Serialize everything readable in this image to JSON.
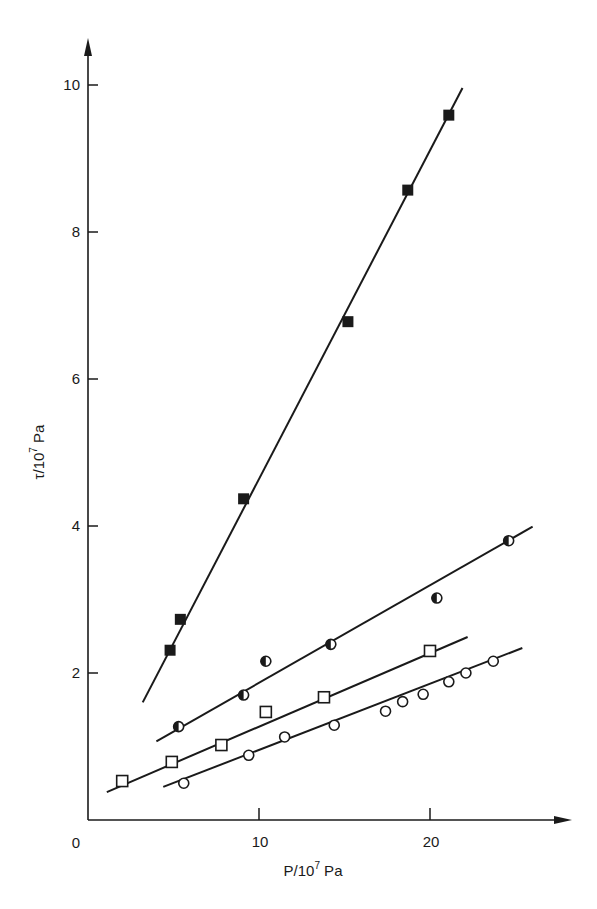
{
  "chart_data": {
    "type": "scatter",
    "title": "",
    "xlabel": "P/10^7 Pa",
    "ylabel": "τ/10^7 Pa",
    "xlabel_parts": {
      "base": "P/10",
      "sup": "7",
      "unit": " Pa"
    },
    "ylabel_parts": {
      "base": "τ/10",
      "sup": "7",
      "unit": " Pa"
    },
    "xlim": [
      0,
      28
    ],
    "ylim": [
      0,
      10.5
    ],
    "x_ticks": [
      10,
      20
    ],
    "x_tick_labels": [
      "10",
      "20"
    ],
    "y_ticks": [
      2,
      4,
      6,
      8,
      10
    ],
    "y_tick_labels": [
      "2",
      "4",
      "6",
      "8",
      "10"
    ],
    "origin_label": "0",
    "grid": false,
    "legend": null,
    "series": [
      {
        "name": "filled squares",
        "marker": "square-filled",
        "points": [
          [
            4.8,
            2.31
          ],
          [
            5.4,
            2.73
          ],
          [
            9.1,
            4.37
          ],
          [
            15.2,
            6.78
          ],
          [
            18.7,
            8.57
          ],
          [
            21.1,
            9.59
          ]
        ],
        "fit_line": [
          [
            3.2,
            1.6
          ],
          [
            21.9,
            9.96
          ]
        ]
      },
      {
        "name": "half-filled circles",
        "marker": "circle-half",
        "points": [
          [
            5.3,
            1.27
          ],
          [
            9.1,
            1.7
          ],
          [
            10.4,
            2.16
          ],
          [
            14.2,
            2.39
          ],
          [
            20.4,
            3.02
          ],
          [
            24.6,
            3.8
          ]
        ],
        "fit_line": [
          [
            4.0,
            1.07
          ],
          [
            26.0,
            3.99
          ]
        ]
      },
      {
        "name": "open squares",
        "marker": "square-open",
        "points": [
          [
            2.0,
            0.53
          ],
          [
            4.9,
            0.79
          ],
          [
            7.8,
            1.02
          ],
          [
            10.4,
            1.47
          ],
          [
            13.8,
            1.67
          ],
          [
            20.0,
            2.3
          ]
        ],
        "fit_line": [
          [
            1.1,
            0.38
          ],
          [
            22.2,
            2.49
          ]
        ]
      },
      {
        "name": "open circles",
        "marker": "circle-open",
        "points": [
          [
            5.6,
            0.5
          ],
          [
            9.4,
            0.88
          ],
          [
            11.5,
            1.13
          ],
          [
            14.4,
            1.29
          ],
          [
            17.4,
            1.48
          ],
          [
            18.4,
            1.61
          ],
          [
            19.6,
            1.71
          ],
          [
            21.1,
            1.88
          ],
          [
            22.1,
            2.0
          ],
          [
            23.7,
            2.16
          ]
        ],
        "fit_line": [
          [
            4.4,
            0.45
          ],
          [
            25.4,
            2.34
          ]
        ]
      }
    ]
  },
  "style": {
    "ink": "#1a1a1a",
    "background": "#ffffff"
  }
}
